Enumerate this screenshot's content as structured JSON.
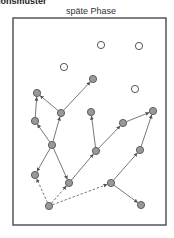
{
  "corner_label": "ionsmuster",
  "title": "späte Phase",
  "frame": {
    "x": 13,
    "y": 18,
    "w": 153,
    "h": 207
  },
  "colors": {
    "frame": "#555555",
    "node_fill": "#999999",
    "node_stroke": "#555555",
    "edge": "#555555",
    "open_node_stroke": "#444444"
  },
  "open_nodes": [
    {
      "id": "o1",
      "x": 101,
      "y": 45
    },
    {
      "id": "o2",
      "x": 139,
      "y": 46
    },
    {
      "id": "o3",
      "x": 64,
      "y": 67
    },
    {
      "id": "o4",
      "x": 135,
      "y": 89
    }
  ],
  "filled_nodes": [
    {
      "id": "A",
      "x": 37,
      "y": 93
    },
    {
      "id": "P",
      "x": 93,
      "y": 79
    },
    {
      "id": "B",
      "x": 61,
      "y": 113
    },
    {
      "id": "C",
      "x": 35,
      "y": 121
    },
    {
      "id": "H",
      "x": 91,
      "y": 112
    },
    {
      "id": "J",
      "x": 123,
      "y": 123
    },
    {
      "id": "L",
      "x": 153,
      "y": 111
    },
    {
      "id": "D",
      "x": 52,
      "y": 145
    },
    {
      "id": "I",
      "x": 96,
      "y": 151
    },
    {
      "id": "M",
      "x": 140,
      "y": 150
    },
    {
      "id": "E",
      "x": 35,
      "y": 175
    },
    {
      "id": "F",
      "x": 69,
      "y": 183
    },
    {
      "id": "K",
      "x": 111,
      "y": 183
    },
    {
      "id": "G",
      "x": 49,
      "y": 206
    },
    {
      "id": "N",
      "x": 141,
      "y": 205
    }
  ],
  "edges": [
    {
      "from": "B",
      "to": "A",
      "style": "solid"
    },
    {
      "from": "B",
      "to": "P",
      "style": "solid"
    },
    {
      "from": "C",
      "to": "A",
      "style": "solid"
    },
    {
      "from": "D",
      "to": "B",
      "style": "solid"
    },
    {
      "from": "D",
      "to": "C",
      "style": "solid"
    },
    {
      "from": "D",
      "to": "E",
      "style": "solid"
    },
    {
      "from": "D",
      "to": "F",
      "style": "solid"
    },
    {
      "from": "F",
      "to": "I",
      "style": "solid"
    },
    {
      "from": "I",
      "to": "H",
      "style": "solid"
    },
    {
      "from": "I",
      "to": "J",
      "style": "solid"
    },
    {
      "from": "J",
      "to": "L",
      "style": "solid"
    },
    {
      "from": "M",
      "to": "L",
      "style": "solid"
    },
    {
      "from": "K",
      "to": "M",
      "style": "solid"
    },
    {
      "from": "K",
      "to": "N",
      "style": "solid"
    },
    {
      "from": "G",
      "to": "E",
      "style": "dashed"
    },
    {
      "from": "G",
      "to": "F",
      "style": "dashed"
    },
    {
      "from": "G",
      "to": "K",
      "style": "dashed"
    }
  ]
}
